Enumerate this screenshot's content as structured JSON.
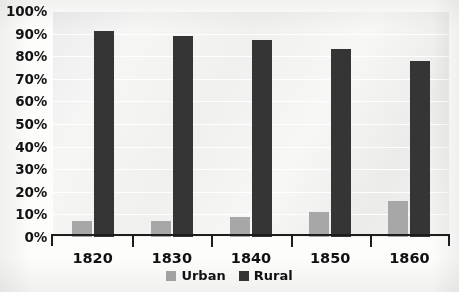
{
  "chart_data": {
    "type": "bar",
    "title": "",
    "subtitle": "",
    "xlabel": "",
    "ylabel": "",
    "categories": [
      "1820",
      "1830",
      "1840",
      "1850",
      "1860"
    ],
    "series": [
      {
        "name": "Urban",
        "color": "#a7a7a7",
        "values": [
          7,
          7,
          9,
          11,
          16
        ]
      },
      {
        "name": "Rural",
        "color": "#353535",
        "values": [
          91,
          89,
          87,
          83,
          78
        ]
      }
    ],
    "ylim": [
      0,
      100
    ],
    "y_ticks": [
      0,
      10,
      20,
      30,
      40,
      50,
      60,
      70,
      80,
      90,
      100
    ],
    "y_tick_labels": [
      "0%",
      "10%",
      "20%",
      "30%",
      "40%",
      "50%",
      "60%",
      "70%",
      "80%",
      "90%",
      "100%"
    ],
    "value_suffix": "%",
    "grid": true,
    "grid_color": "#ffffff",
    "plot_background": "#f2f2f0",
    "legend_position": "bottom",
    "legend": [
      {
        "label": "Urban",
        "color": "#a7a7a7",
        "swatch": "legend-swatch-urban"
      },
      {
        "label": "Rural",
        "color": "#353535",
        "swatch": "legend-swatch-rural"
      }
    ]
  }
}
